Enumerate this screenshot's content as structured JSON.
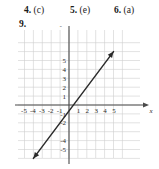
{
  "answers": {
    "items": [
      {
        "number": "4.",
        "value": "(c)"
      },
      {
        "number": "5.",
        "value": "(e)"
      },
      {
        "number": "6.",
        "value": "(a)"
      }
    ]
  },
  "problem": {
    "label": "9."
  },
  "chart_data": {
    "type": "line",
    "title": "",
    "xlabel": "x",
    "ylabel": "y",
    "xlim": [
      -6,
      6
    ],
    "ylim": [
      -7,
      7
    ],
    "grid": true,
    "legend": false,
    "x_ticks": [
      "-5",
      "-4",
      "-3",
      "-2",
      "-1",
      "1",
      "2",
      "3",
      "4",
      "5"
    ],
    "x_tick_values": [
      -5,
      -4,
      -3,
      -2,
      -1,
      1,
      2,
      3,
      4,
      5
    ],
    "y_ticks": [
      "5",
      "4",
      "3",
      "2",
      "1",
      "-1",
      "-2",
      "-4",
      "-5"
    ],
    "y_tick_values": [
      5,
      4,
      3,
      2,
      1,
      -1,
      -2,
      -4,
      -5
    ],
    "series": [
      {
        "name": "line",
        "points": [
          [
            -4,
            -6
          ],
          [
            5,
            6
          ]
        ],
        "slope": 1.3333,
        "intercept": -0.6667,
        "arrow_start": true,
        "arrow_end": true,
        "color": "#2b2b2b"
      }
    ]
  },
  "colors": {
    "grid": "#cfcfcf",
    "axis": "#4a4a4a",
    "line": "#2b2b2b",
    "text": "#1a1a1a",
    "background": "#ffffff"
  }
}
